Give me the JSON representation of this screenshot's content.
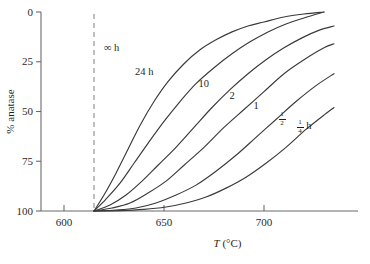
{
  "chart_data": {
    "type": "line",
    "title": "",
    "xlabel": "T (°C)",
    "ylabel": "% anatase",
    "xlim": [
      588,
      735
    ],
    "ylim": [
      100,
      0
    ],
    "y_inverted": true,
    "grid": false,
    "legend": "inline-curve-labels",
    "xticks": [
      600,
      650,
      700
    ],
    "xtick_labels": [
      "600",
      "650",
      "700"
    ],
    "yticks": [
      0,
      25,
      50,
      75,
      100
    ],
    "ytick_labels": [
      "0",
      "25",
      "50",
      "75",
      "100"
    ],
    "annotations": [
      {
        "text": "∞ h",
        "x": 618,
        "y": 18,
        "kind": "asymptote-label"
      }
    ],
    "asymptote": {
      "x": 615,
      "label": "∞ h",
      "style": "dashed-vertical"
    },
    "series": [
      {
        "name": "24 h",
        "label": "24 h",
        "label_x": 640,
        "label_y": 30,
        "x": [
          615,
          620,
          626,
          632,
          638,
          645,
          652,
          660,
          668,
          676,
          684,
          692,
          700,
          710,
          720,
          730
        ],
        "y": [
          100,
          92,
          81,
          69,
          57,
          45,
          35,
          26,
          19,
          14,
          10,
          7,
          5,
          2.5,
          1,
          0
        ]
      },
      {
        "name": "10 h",
        "label": "10",
        "label_x": 670,
        "label_y": 36,
        "x": [
          615,
          621,
          628,
          635,
          642,
          650,
          658,
          666,
          675,
          684,
          693,
          702,
          711,
          720,
          730
        ],
        "y": [
          100,
          94,
          86,
          76,
          66,
          55,
          45,
          36,
          28,
          21,
          15,
          10,
          6,
          3,
          0
        ]
      },
      {
        "name": "2 h",
        "label": "2",
        "label_x": 684,
        "label_y": 42,
        "x": [
          615,
          623,
          631,
          639,
          647,
          656,
          665,
          674,
          683,
          692,
          701,
          710,
          719,
          728,
          735
        ],
        "y": [
          100,
          97,
          92,
          85,
          77,
          68,
          58,
          48,
          39,
          31,
          24,
          18,
          13,
          9,
          7
        ]
      },
      {
        "name": "1 h",
        "label": "1",
        "label_x": 696,
        "label_y": 47,
        "x": [
          615,
          624,
          633,
          642,
          651,
          660,
          670,
          680,
          690,
          700,
          710,
          720,
          730,
          735
        ],
        "y": [
          100,
          98.5,
          96,
          91,
          85,
          77,
          68,
          58,
          49,
          40,
          31,
          24,
          18,
          16
        ]
      },
      {
        "name": "1/2 h",
        "label": "½",
        "label_numerator": "1",
        "label_denominator": "2",
        "label_x": 709,
        "label_y": 54,
        "x": [
          615,
          626,
          636,
          646,
          656,
          666,
          676,
          686,
          696,
          706,
          716,
          726,
          735
        ],
        "y": [
          100,
          99.5,
          98.5,
          96,
          92,
          87,
          80,
          72,
          63,
          54,
          45,
          37,
          31
        ]
      },
      {
        "name": "1/4 h",
        "label": "¼ h",
        "label_numerator": "1",
        "label_denominator": "4",
        "label_unit": "h",
        "label_x": 720,
        "label_y": 58,
        "x": [
          615,
          628,
          640,
          651,
          661,
          671,
          681,
          691,
          701,
          711,
          721,
          731,
          735
        ],
        "y": [
          100,
          99.8,
          99.2,
          98,
          96,
          93,
          88.5,
          83,
          76,
          68,
          59,
          51,
          48
        ]
      }
    ]
  }
}
